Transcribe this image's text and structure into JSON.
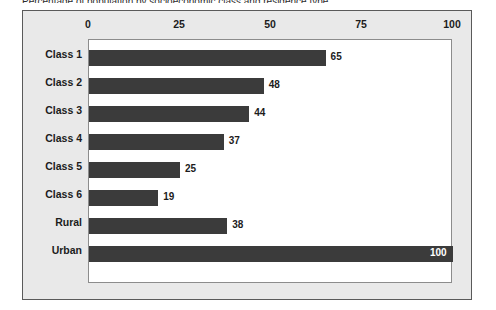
{
  "figure": {
    "caption_sliver": "Percentage of population by socioeconomic class and residence type",
    "background_color": "#e9e9e9",
    "plot_background_color": "#ffffff",
    "bar_color": "#3b3b3b"
  },
  "chart_data": {
    "type": "bar",
    "orientation": "horizontal",
    "title": "",
    "xlabel": "",
    "ylabel": "",
    "xlim": [
      0,
      100
    ],
    "xticks": [
      0,
      25,
      50,
      75,
      100
    ],
    "xtick_labels": [
      "0",
      "25",
      "50",
      "75",
      "100"
    ],
    "grid": false,
    "legend": false,
    "axis_position": "top",
    "categories": [
      "Class 1",
      "Class 2",
      "Class 3",
      "Class 4",
      "Class 5",
      "Class 6",
      "Rural",
      "Urban"
    ],
    "values": [
      65,
      48,
      44,
      37,
      25,
      19,
      38,
      100
    ],
    "value_labels": [
      "65",
      "48",
      "44",
      "37",
      "25",
      "19",
      "38",
      "100"
    ],
    "label_placement": [
      "outside",
      "outside",
      "outside",
      "outside",
      "outside",
      "outside",
      "outside",
      "inside"
    ]
  }
}
